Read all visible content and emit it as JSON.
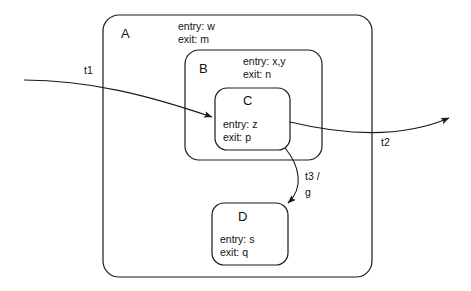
{
  "diagram": {
    "type": "uml-statechart",
    "title": "",
    "background_color": "#ffffff",
    "line_color": "#1a1a1a",
    "states": [
      {
        "id": "A",
        "name": "A",
        "entry": "entry: w",
        "exit": "exit: m",
        "parent": null,
        "box": {
          "x": 103,
          "y": 15,
          "width": 269,
          "height": 262
        }
      },
      {
        "id": "B",
        "name": "B",
        "entry": "entry: x,y",
        "exit": "exit: n",
        "parent": "A",
        "box": {
          "x": 185,
          "y": 50,
          "width": 137,
          "height": 110
        }
      },
      {
        "id": "C",
        "name": "C",
        "entry": "entry: z",
        "exit": "exit: p",
        "parent": "B",
        "box": {
          "x": 215,
          "y": 88,
          "width": 75,
          "height": 62
        }
      },
      {
        "id": "D",
        "name": "D",
        "entry": "entry: s",
        "exit": "exit: q",
        "parent": "A",
        "box": {
          "x": 212,
          "y": 203,
          "width": 76,
          "height": 62
        }
      }
    ],
    "transitions": [
      {
        "id": "t1",
        "label": "t1",
        "source": "external-left",
        "target": "C",
        "label_x": 84,
        "label_y": 74
      },
      {
        "id": "t2",
        "label": "t2",
        "source": "C",
        "target": "external-right",
        "label_x": 381,
        "label_y": 146
      },
      {
        "id": "t3",
        "label_line1": "t3 /",
        "label_line2": "g",
        "source": "C",
        "target": "D",
        "label_x": 305,
        "label_y": 180
      }
    ]
  }
}
